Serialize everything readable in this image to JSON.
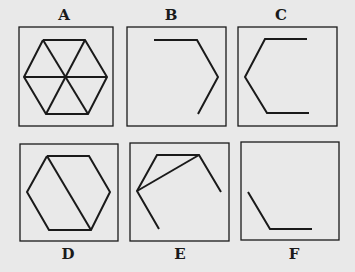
{
  "panels": [
    {
      "label": "A",
      "label_pos": "top",
      "box": [
        19,
        27,
        94,
        99
      ],
      "label_x": 49,
      "label_y": 8,
      "polylines": [
        [
          [
            43,
            40
          ],
          [
            85,
            40
          ],
          [
            107,
            77
          ],
          [
            88,
            114
          ],
          [
            46,
            114
          ],
          [
            24,
            77
          ],
          [
            43,
            40
          ]
        ],
        [
          [
            43,
            40
          ],
          [
            88,
            114
          ]
        ],
        [
          [
            85,
            40
          ],
          [
            46,
            114
          ]
        ],
        [
          [
            24,
            77
          ],
          [
            107,
            77
          ]
        ]
      ]
    },
    {
      "label": "B",
      "label_pos": "top",
      "box": [
        127,
        27,
        99,
        99
      ],
      "label_x": 156,
      "label_y": 8,
      "polylines": [
        [
          [
            154,
            40
          ],
          [
            197,
            40
          ],
          [
            218,
            77
          ],
          [
            198,
            114
          ]
        ]
      ]
    },
    {
      "label": "C",
      "label_pos": "top",
      "box": [
        238,
        27,
        99,
        99
      ],
      "label_x": 267,
      "label_y": 8,
      "polylines": [
        [
          [
            307,
            39
          ],
          [
            265,
            39
          ],
          [
            245,
            77
          ],
          [
            267,
            113
          ],
          [
            309,
            113
          ]
        ]
      ]
    },
    {
      "label": "D",
      "label_pos": "bottom",
      "box": [
        20,
        144,
        98,
        97
      ],
      "label_x": 53,
      "label_y": 246,
      "polylines": [
        [
          [
            47,
            156
          ],
          [
            89,
            156
          ],
          [
            110,
            192
          ],
          [
            91,
            230
          ],
          [
            49,
            230
          ],
          [
            27,
            192
          ],
          [
            47,
            156
          ]
        ],
        [
          [
            47,
            156
          ],
          [
            91,
            230
          ]
        ]
      ]
    },
    {
      "label": "E",
      "label_pos": "bottom",
      "box": [
        130,
        143,
        99,
        98
      ],
      "label_x": 165,
      "label_y": 246,
      "polylines": [
        [
          [
            159,
            229
          ],
          [
            137,
            191
          ],
          [
            157,
            155
          ],
          [
            199,
            155
          ],
          [
            221,
            192
          ]
        ],
        [
          [
            137,
            191
          ],
          [
            199,
            155
          ]
        ]
      ]
    },
    {
      "label": "F",
      "label_pos": "bottom",
      "box": [
        241,
        142,
        98,
        98
      ],
      "label_x": 279,
      "label_y": 246,
      "polylines": [
        [
          [
            248,
            192
          ],
          [
            270,
            229
          ],
          [
            312,
            229
          ]
        ]
      ]
    }
  ],
  "colors": {
    "background": "#e9e9e9",
    "stroke": "#1a1a1a"
  }
}
